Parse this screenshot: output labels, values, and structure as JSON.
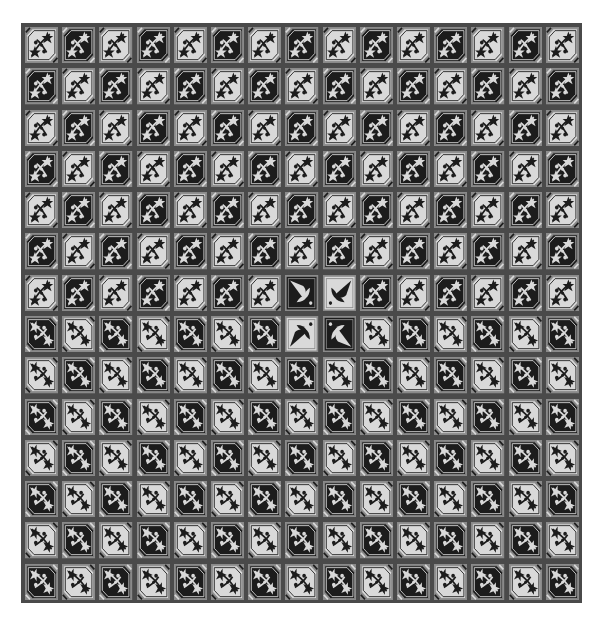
{
  "board": {
    "columns": 15,
    "rows": 14,
    "colors": {
      "grout": "#4a4a4a",
      "light_tile": "#d9d9d9",
      "dark_tile": "#1c1c1c",
      "frame": "#8a8a8a"
    },
    "row_start_shades": [
      "light",
      "dark",
      "light",
      "dark",
      "light",
      "dark",
      "light",
      "dark",
      "light",
      "dark",
      "light",
      "dark",
      "light",
      "dark"
    ],
    "row_orientation": [
      "A",
      "A",
      "A",
      "A",
      "A",
      "A",
      "A",
      "B",
      "B",
      "B",
      "B",
      "B",
      "B",
      "B"
    ],
    "special_tiles": [
      {
        "row": 7,
        "col": 8,
        "motif": "fleur-de-lis",
        "shade": "dark",
        "rotation": 0
      },
      {
        "row": 7,
        "col": 9,
        "motif": "fleur-de-lis",
        "shade": "light",
        "rotation": 90
      },
      {
        "row": 8,
        "col": 8,
        "motif": "fleur-de-lis",
        "shade": "light",
        "rotation": 270
      },
      {
        "row": 8,
        "col": 9,
        "motif": "fleur-de-lis",
        "shade": "dark",
        "rotation": 180
      }
    ],
    "default_motif": "floral-octagon"
  }
}
